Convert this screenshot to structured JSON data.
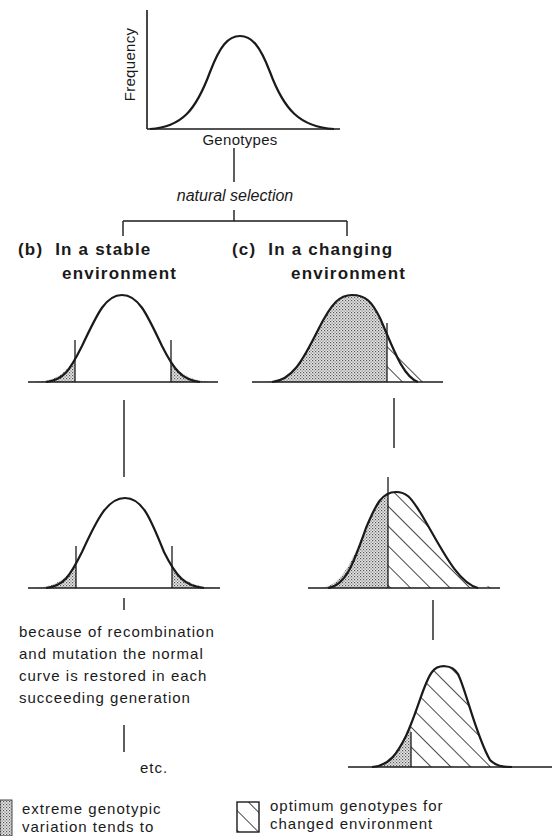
{
  "top_graph": {
    "y_axis_label": "Frequency",
    "x_axis_label": "Genotypes"
  },
  "process_label": "natural selection",
  "branches": {
    "b": {
      "marker": "(b)",
      "title_line1": "In a stable",
      "title_line2": "environment",
      "explanation": [
        "because of recombination",
        "and mutation the normal",
        "curve is restored in each",
        "succeeding generation"
      ],
      "continuation": "etc."
    },
    "c": {
      "marker": "(c)",
      "title_line1": "In a changing",
      "title_line2": "environment"
    }
  },
  "legend": {
    "stippled": {
      "pattern": "stipple-pattern",
      "line1": "extreme genotypic",
      "line2": "variation tends to"
    },
    "hatched": {
      "pattern": "diagonal-hatch-pattern",
      "line1": "optimum genotypes for",
      "line2": "changed environment"
    }
  },
  "colors": {
    "ink": "#1a1a1a",
    "stipple": "#bdbdbd",
    "background": "#ffffff"
  }
}
